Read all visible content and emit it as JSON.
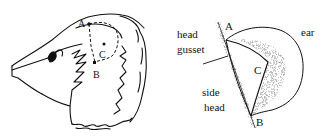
{
  "figure": {
    "left_panel": {
      "labels": {
        "a": "A",
        "b": "B",
        "c": "C"
      }
    },
    "right_panel": {
      "labels": {
        "a": "A",
        "b": "B",
        "c": "C",
        "head_gusset_1": "head",
        "head_gusset_2": "gusset",
        "side_head_1": "side",
        "side_head_2": "head",
        "ear": "ear"
      }
    }
  }
}
